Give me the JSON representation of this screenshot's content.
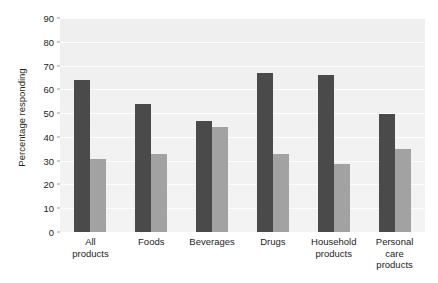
{
  "chart_data": {
    "type": "bar",
    "title": "",
    "xlabel": "",
    "ylabel": "Percentage responding",
    "ylim": [
      0,
      90
    ],
    "yticks": [
      0,
      10,
      20,
      30,
      40,
      50,
      60,
      70,
      80,
      90
    ],
    "grid": true,
    "legend_position": "top-center",
    "categories": [
      "All\nproducts",
      "Foods",
      "Beverages",
      "Drugs",
      "Household\nproducts",
      "Personal\ncare\nproducts"
    ],
    "series": [
      {
        "name": "Believe the quality of store\nbrands and manufacturers'\nbrands are about the same.",
        "color": "#4a4a4a",
        "values": [
          64,
          54,
          46.5,
          67,
          66,
          49.5
        ]
      },
      {
        "name": "Won't buy store\nbrands at all.",
        "color": "#a2a2a2",
        "values": [
          30.5,
          33,
          44,
          33,
          28.5,
          35
        ]
      }
    ]
  }
}
